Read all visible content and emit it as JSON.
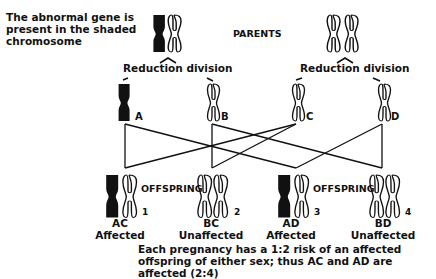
{
  "intro_text": "The abnormal gene is present in the shaded chromosome",
  "parents_label": "PARENTS",
  "reduction_labels": [
    "Reduction division",
    "Reduction division"
  ],
  "gametes": [
    {
      "label": "A",
      "shaded": true
    },
    {
      "label": "B",
      "shaded": false
    },
    {
      "label": "C",
      "shaded": false
    },
    {
      "label": "D",
      "shaded": false
    }
  ],
  "offspring_label": "OFFSPRING",
  "offspring": [
    {
      "number": "1",
      "genotype": "AC",
      "status": "Affected",
      "shaded": true
    },
    {
      "number": "2",
      "genotype": "BC",
      "status": "Unaffected",
      "shaded": false
    },
    {
      "number": "3",
      "genotype": "AD",
      "status": "Affected",
      "shaded": true
    },
    {
      "number": "4",
      "genotype": "BD",
      "status": "Unaffected",
      "shaded": false
    }
  ],
  "footnote": "Each pregnancy has a 1:2 risk of an affected offspring of either sex; thus AC and AD are affected (2:4)",
  "colors": {
    "ink": "#111111",
    "background": "#ffffff"
  }
}
